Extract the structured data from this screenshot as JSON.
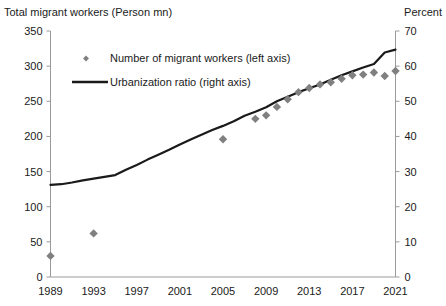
{
  "axis_titles": {
    "left": "Total migrant workers (Person mn)",
    "right": "Percent"
  },
  "legend": {
    "scatter": "Number of migrant workers (left axis)",
    "line": "Urbanization ratio (right axis)"
  },
  "colors": {
    "scatter": "#808080",
    "line": "#1a1a1a",
    "axis": "#9a9a9a",
    "text": "#1a1a1a",
    "background": "#ffffff"
  },
  "chart_data": {
    "type": "scatter",
    "title": "",
    "xlabel": "",
    "ylabel": "Total migrant workers (Person mn)",
    "y2label": "Percent",
    "xlim": [
      1989,
      2021
    ],
    "ylim": [
      0,
      350
    ],
    "y2lim": [
      0,
      70
    ],
    "ytick_labels": [
      "0",
      "50",
      "100",
      "150",
      "200",
      "250",
      "300",
      "350"
    ],
    "yticks": [
      0,
      50,
      100,
      150,
      200,
      250,
      300,
      350
    ],
    "y2tick_labels": [
      "0",
      "10",
      "20",
      "30",
      "40",
      "50",
      "60",
      "70"
    ],
    "y2ticks": [
      0,
      10,
      20,
      30,
      40,
      50,
      60,
      70
    ],
    "xtick_labels": [
      "1989",
      "1993",
      "1997",
      "2001",
      "2005",
      "2009",
      "2013",
      "2017",
      "2021"
    ],
    "xticks": [
      1989,
      1993,
      1997,
      2001,
      2005,
      2009,
      2013,
      2017,
      2021
    ],
    "grid": false,
    "legend_position": "upper-left-inside",
    "series": [
      {
        "name": "Number of migrant workers (left axis)",
        "type": "scatter",
        "axis": "left",
        "marker": "diamond",
        "color": "#808080",
        "x": [
          1989,
          1993,
          2005,
          2008,
          2009,
          2010,
          2011,
          2012,
          2013,
          2014,
          2015,
          2016,
          2017,
          2018,
          2019,
          2020,
          2021
        ],
        "y": [
          30,
          62,
          196,
          225,
          230,
          242,
          253,
          263,
          269,
          274,
          277,
          282,
          287,
          288,
          291,
          286,
          293
        ]
      },
      {
        "name": "Urbanization ratio (right axis)",
        "type": "line",
        "axis": "right",
        "color": "#1a1a1a",
        "x": [
          1989,
          1990,
          1991,
          1992,
          1993,
          1994,
          1995,
          1996,
          1997,
          1998,
          1999,
          2000,
          2001,
          2002,
          2003,
          2004,
          2005,
          2006,
          2007,
          2008,
          2009,
          2010,
          2011,
          2012,
          2013,
          2014,
          2015,
          2016,
          2017,
          2018,
          2019,
          2020,
          2021
        ],
        "y": [
          26.2,
          26.4,
          26.9,
          27.5,
          28.0,
          28.5,
          29.0,
          30.5,
          31.9,
          33.4,
          34.8,
          36.2,
          37.7,
          39.1,
          40.5,
          41.8,
          43.0,
          44.3,
          45.9,
          47.0,
          48.3,
          50.0,
          51.3,
          52.6,
          53.7,
          54.8,
          56.1,
          57.4,
          58.5,
          59.6,
          60.6,
          63.9,
          64.7
        ]
      }
    ]
  }
}
